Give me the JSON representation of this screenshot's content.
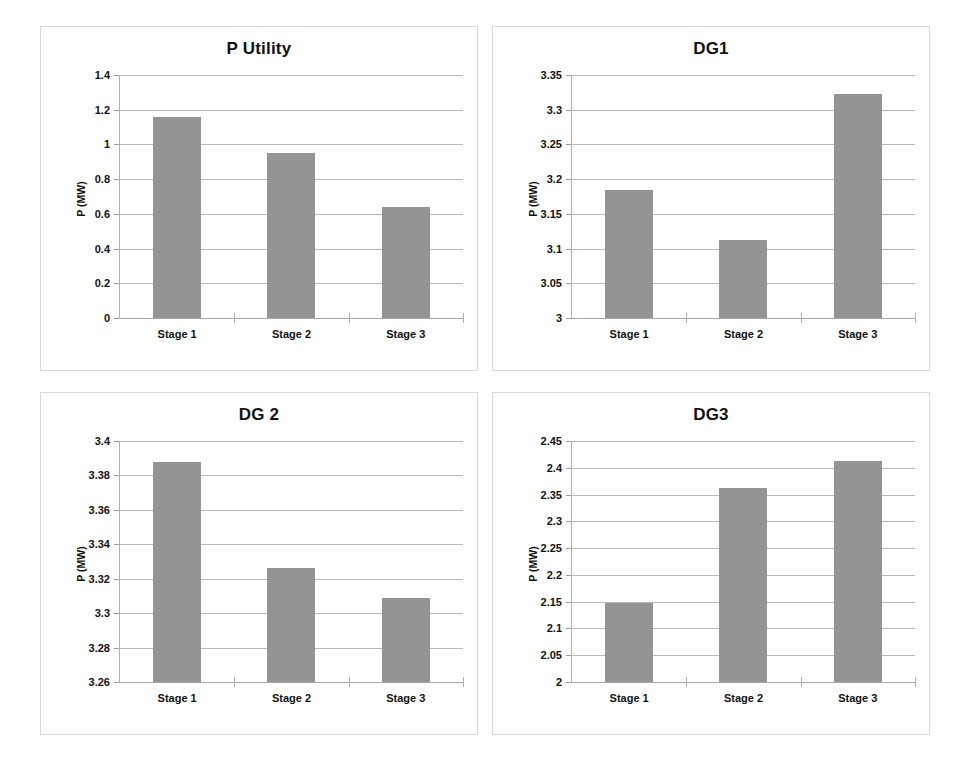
{
  "figure": {
    "bar_color": "#949494",
    "grid_color": "#b9b9b9",
    "background": "#ffffff"
  },
  "chart_data": [
    {
      "type": "bar",
      "title": "P Utility",
      "xlabel": "",
      "ylabel": "P (MW)",
      "categories": [
        "Stage 1",
        "Stage 2",
        "Stage 3"
      ],
      "values": [
        1.158,
        0.949,
        0.638
      ],
      "ylim": [
        0,
        1.4
      ],
      "yticks": [
        "0",
        "0.2",
        "0.4",
        "0.6",
        "0.8",
        "1",
        "1.2",
        "1.4"
      ],
      "ytick_values": [
        0,
        0.2,
        0.4,
        0.6,
        0.8,
        1.0,
        1.2,
        1.4
      ],
      "grid": true,
      "legend": "none"
    },
    {
      "type": "bar",
      "title": "DG1",
      "xlabel": "",
      "ylabel": "P (MW)",
      "categories": [
        "Stage 1",
        "Stage 2",
        "Stage 3"
      ],
      "values": [
        3.185,
        3.113,
        3.322
      ],
      "ylim": [
        3,
        3.35
      ],
      "yticks": [
        "3",
        "3.05",
        "3.1",
        "3.15",
        "3.2",
        "3.25",
        "3.3",
        "3.35"
      ],
      "ytick_values": [
        3,
        3.05,
        3.1,
        3.15,
        3.2,
        3.25,
        3.3,
        3.35
      ],
      "grid": true,
      "legend": "none"
    },
    {
      "type": "bar",
      "title": "DG 2",
      "xlabel": "",
      "ylabel": "P (MW)",
      "categories": [
        "Stage 1",
        "Stage 2",
        "Stage 3"
      ],
      "values": [
        3.388,
        3.326,
        3.309
      ],
      "ylim": [
        3.26,
        3.4
      ],
      "yticks": [
        "3.26",
        "3.28",
        "3.3",
        "3.32",
        "3.34",
        "3.36",
        "3.38",
        "3.4"
      ],
      "ytick_values": [
        3.26,
        3.28,
        3.3,
        3.32,
        3.34,
        3.36,
        3.38,
        3.4
      ],
      "grid": true,
      "legend": "none"
    },
    {
      "type": "bar",
      "title": "DG3",
      "xlabel": "",
      "ylabel": "P (MW)",
      "categories": [
        "Stage 1",
        "Stage 2",
        "Stage 3"
      ],
      "values": [
        2.148,
        2.362,
        2.413
      ],
      "ylim": [
        2,
        2.45
      ],
      "yticks": [
        "2",
        "2.05",
        "2.1",
        "2.15",
        "2.2",
        "2.25",
        "2.3",
        "2.35",
        "2.4",
        "2.45"
      ],
      "ytick_values": [
        2,
        2.05,
        2.1,
        2.15,
        2.2,
        2.25,
        2.3,
        2.35,
        2.4,
        2.45
      ],
      "grid": true,
      "legend": "none"
    }
  ]
}
